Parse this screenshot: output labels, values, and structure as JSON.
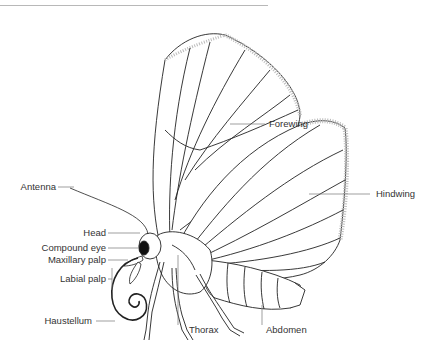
{
  "diagram": {
    "labels": {
      "forewing": "Forewing",
      "hindwing": "Hindwing",
      "antenna": "Antenna",
      "head": "Head",
      "compound_eye": "Compound eye",
      "maxillary_palp": "Maxillary palp",
      "labial_palp": "Labial palp",
      "haustellum": "Haustellum",
      "thorax": "Thorax",
      "abdomen": "Abdomen"
    },
    "colors": {
      "line": "#222222",
      "leader": "#777777",
      "fringe": "#bbbbbb",
      "eye": "#111111"
    }
  }
}
